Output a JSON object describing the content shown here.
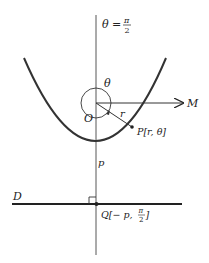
{
  "diagram": {
    "type": "parabola-polar-coordinates",
    "labels": {
      "axis_angle": "θ = ",
      "axis_angle_num": "π",
      "axis_angle_den": "2",
      "angle": "θ",
      "origin": "O",
      "ray_end": "M",
      "radius": "r",
      "point_p": "P[r, θ]",
      "distance": "p",
      "directrix": "D",
      "point_q_prefix": "Q[− p, ",
      "point_q_num": "π",
      "point_q_den": "2",
      "point_q_suffix": "]"
    },
    "colors": {
      "line": "#222222",
      "thin_line": "#444444",
      "background": "#ffffff"
    }
  }
}
